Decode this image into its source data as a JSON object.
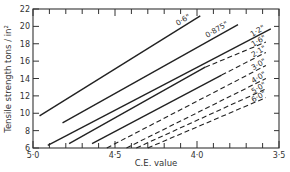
{
  "chart_data": {
    "type": "line",
    "title": "",
    "xlabel": "C.E. value",
    "ylabel": "Tensile strength tons / in²",
    "xlim": [
      5.0,
      3.5
    ],
    "ylim": [
      6,
      22
    ],
    "x_inverted": true,
    "x_ticks": [
      {
        "value": 5.0,
        "label": "5·0"
      },
      {
        "value": 4.5,
        "label": "4·5"
      },
      {
        "value": 4.0,
        "label": "4·0"
      },
      {
        "value": 3.5,
        "label": "3·5"
      }
    ],
    "x_minor_step": 0.1,
    "y_ticks": [
      6,
      8,
      10,
      12,
      14,
      16,
      18,
      20,
      22
    ],
    "grid": false,
    "legend": "inline labels at line ends",
    "series": [
      {
        "name": "0·6\"",
        "label": "0·6\"",
        "solid": [
          [
            4.96,
            9.7
          ],
          [
            3.98,
            21.2
          ]
        ],
        "dashed": null
      },
      {
        "name": "0·875\"",
        "label": "0·875\"",
        "solid": [
          [
            4.82,
            8.9
          ],
          [
            3.75,
            20.2
          ]
        ],
        "dashed": null
      },
      {
        "name": "1·2\"",
        "label": "1·2\"",
        "solid": [
          [
            4.91,
            6.3
          ],
          [
            3.55,
            19.7
          ]
        ],
        "dashed": null
      },
      {
        "name": "1·6\"",
        "label": "1·6\"",
        "solid": [
          [
            4.78,
            6.5
          ],
          [
            3.95,
            15.3
          ]
        ],
        "dashed": [
          [
            3.95,
            15.3
          ],
          [
            3.58,
            18.2
          ]
        ]
      },
      {
        "name": "2·1\"",
        "label": "2·1\"",
        "solid": [
          [
            4.64,
            6.5
          ],
          [
            3.85,
            14.4
          ]
        ],
        "dashed": [
          [
            3.85,
            14.4
          ],
          [
            3.58,
            17.0
          ]
        ]
      },
      {
        "name": "3·0\"",
        "label": "3·0\"",
        "solid": null,
        "dashed": [
          [
            4.55,
            6.0
          ],
          [
            3.58,
            15.5
          ]
        ]
      },
      {
        "name": "4·0\"",
        "label": "4·0\"",
        "solid": null,
        "dashed": [
          [
            4.43,
            6.0
          ],
          [
            3.58,
            14.0
          ]
        ]
      },
      {
        "name": "5·0\"",
        "label": "5·0\"",
        "solid": null,
        "dashed": [
          [
            4.37,
            6.0
          ],
          [
            3.58,
            12.8
          ]
        ]
      },
      {
        "name": "6·0\"",
        "label": "6·0\"",
        "solid": null,
        "dashed": [
          [
            4.3,
            6.0
          ],
          [
            3.58,
            11.8
          ]
        ]
      }
    ],
    "colors": {
      "line": "#222222",
      "axis": "#333333",
      "background": "#ffffff"
    }
  }
}
